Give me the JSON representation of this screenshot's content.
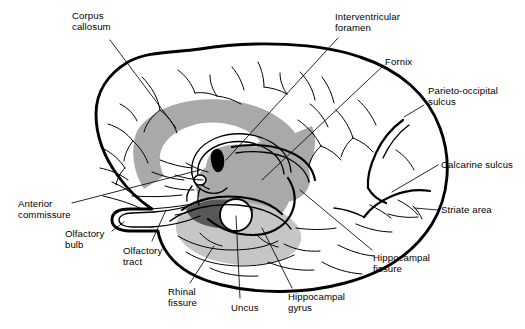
{
  "figure": {
    "type": "anatomical-line-diagram",
    "background_color": "#ffffff",
    "line_color": "#000000",
    "palette": {
      "corpus_callosum_gray": "#a9a9a9",
      "thalamus_gray": "#a9a9a9",
      "hippocampal_gyrus_light_gray": "#c6c6c6",
      "uncus_dark_gray": "#585858",
      "foramen_black": "#000000",
      "outline_black": "#000000"
    }
  },
  "labels": [
    {
      "id": "corpus-callosum",
      "text": "Corpus\ncallosum",
      "x": 72,
      "y": 10,
      "align": "left"
    },
    {
      "id": "interventricular-foramen",
      "text": "Interventricular\nforamen",
      "x": 335,
      "y": 11,
      "align": "left"
    },
    {
      "id": "fornix",
      "text": "Fornix",
      "x": 385,
      "y": 56,
      "align": "left"
    },
    {
      "id": "parieto-occipital-sulcus",
      "text": "Parieto-occipital\nsulcus",
      "x": 428,
      "y": 85,
      "align": "left"
    },
    {
      "id": "calcarine-sulcus",
      "text": "Calcarine sulcus",
      "x": 441,
      "y": 159,
      "align": "left"
    },
    {
      "id": "striate-area",
      "text": "Striate area",
      "x": 441,
      "y": 204,
      "align": "left"
    },
    {
      "id": "hippocampal-fissure",
      "text": "Hippocampal\nfissure",
      "x": 373,
      "y": 252,
      "align": "left"
    },
    {
      "id": "hippocampal-gyrus",
      "text": "Hippocampal\ngyrus",
      "x": 288,
      "y": 291,
      "align": "left"
    },
    {
      "id": "uncus",
      "text": "Uncus",
      "x": 231,
      "y": 302,
      "align": "left"
    },
    {
      "id": "rhinal-fissure",
      "text": "Rhinal\nfissure",
      "x": 168,
      "y": 286,
      "align": "left"
    },
    {
      "id": "olfactory-tract",
      "text": "Olfactory\ntract",
      "x": 123,
      "y": 245,
      "align": "left"
    },
    {
      "id": "olfactory-bulb",
      "text": "Olfactory\nbulb",
      "x": 65,
      "y": 228,
      "align": "left"
    },
    {
      "id": "anterior-commissure",
      "text": "Anterior\ncommissure",
      "x": 18,
      "y": 198,
      "align": "left"
    }
  ],
  "structures": [
    {
      "id": "cerebrum-outline",
      "name": "cerebral hemisphere outline"
    },
    {
      "id": "corpus-callosum-band",
      "name": "corpus callosum (gray C-shaped band)"
    },
    {
      "id": "thalamus-region",
      "name": "thalamus / diencephalon (gray mass)"
    },
    {
      "id": "fornix-arc",
      "name": "fornix (arched fiber bundle)"
    },
    {
      "id": "interventricular-foramen-marker",
      "name": "interventricular foramen (black teardrop)"
    },
    {
      "id": "uncus-circle",
      "name": "uncus (white circle)"
    },
    {
      "id": "uncus-dark-patch",
      "name": "amygdaloid / uncal dark gray patch"
    },
    {
      "id": "hippocampal-gyrus-band",
      "name": "parahippocampal gyrus (light gray)"
    },
    {
      "id": "olfactory-bulb-shape",
      "name": "olfactory bulb hook"
    },
    {
      "id": "olfactory-tract-line",
      "name": "olfactory tract"
    },
    {
      "id": "parieto-occipital-notch",
      "name": "parieto-occipital sulcus notch"
    },
    {
      "id": "calcarine-branch",
      "name": "calcarine sulcus"
    },
    {
      "id": "rhinal-fissure-line",
      "name": "rhinal fissure"
    },
    {
      "id": "temporal-lobe",
      "name": "temporal lobe"
    },
    {
      "id": "cortical-sulci",
      "name": "cortical sulci network"
    }
  ]
}
